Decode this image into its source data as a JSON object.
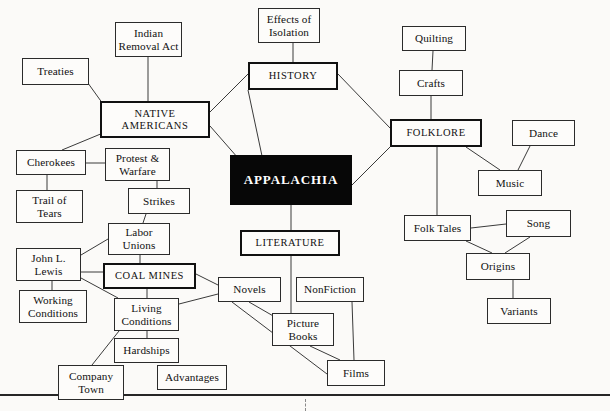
{
  "document": {
    "type": "concept-map",
    "title": "APPALACHIA",
    "background_color": "#fbfaf8",
    "ink_color": "#111111",
    "central_fill": "#070707",
    "central_text_color": "#ffffff"
  },
  "nodes": [
    {
      "id": "appalachia",
      "label": "APPALACHIA",
      "style": "central",
      "x": 230,
      "y": 155,
      "w": 122,
      "h": 50
    },
    {
      "id": "history",
      "label": "HISTORY",
      "style": "major",
      "x": 248,
      "y": 62,
      "w": 90,
      "h": 28
    },
    {
      "id": "native-americans",
      "label": "NATIVE\nAMERICANS",
      "style": "major",
      "x": 100,
      "y": 101,
      "w": 110,
      "h": 37
    },
    {
      "id": "folklore",
      "label": "FOLKLORE",
      "style": "major",
      "x": 390,
      "y": 119,
      "w": 92,
      "h": 28
    },
    {
      "id": "literature",
      "label": "LITERATURE",
      "style": "major",
      "x": 240,
      "y": 230,
      "w": 100,
      "h": 26
    },
    {
      "id": "coal-mines",
      "label": "COAL MINES",
      "style": "major",
      "x": 103,
      "y": 263,
      "w": 93,
      "h": 26
    },
    {
      "id": "effects-of-isolation",
      "label": "Effects of\nIsolation",
      "style": "sub",
      "x": 258,
      "y": 8,
      "w": 62,
      "h": 35
    },
    {
      "id": "indian-removal-act",
      "label": "Indian\nRemoval Act",
      "style": "sub",
      "x": 115,
      "y": 22,
      "w": 67,
      "h": 35
    },
    {
      "id": "treaties",
      "label": "Treaties",
      "style": "sub",
      "x": 22,
      "y": 58,
      "w": 67,
      "h": 27
    },
    {
      "id": "cherokees",
      "label": "Cherokees",
      "style": "sub",
      "x": 16,
      "y": 150,
      "w": 70,
      "h": 25
    },
    {
      "id": "trail-of-tears",
      "label": "Trail of\nTears",
      "style": "sub",
      "x": 16,
      "y": 190,
      "w": 67,
      "h": 33
    },
    {
      "id": "protest-warfare",
      "label": "Protest &\nWarfare",
      "style": "sub",
      "x": 105,
      "y": 148,
      "w": 65,
      "h": 33
    },
    {
      "id": "strikes",
      "label": "Strikes",
      "style": "sub",
      "x": 128,
      "y": 188,
      "w": 62,
      "h": 26
    },
    {
      "id": "labor-unions",
      "label": "Labor\nUnions",
      "style": "sub",
      "x": 108,
      "y": 223,
      "w": 62,
      "h": 32
    },
    {
      "id": "john-l-lewis",
      "label": "John L.\nLewis",
      "style": "sub",
      "x": 16,
      "y": 248,
      "w": 65,
      "h": 33
    },
    {
      "id": "working-conditions",
      "label": "Working\nConditions",
      "style": "sub",
      "x": 19,
      "y": 290,
      "w": 68,
      "h": 33
    },
    {
      "id": "living-conditions",
      "label": "Living\nConditions",
      "style": "sub",
      "x": 114,
      "y": 298,
      "w": 65,
      "h": 33
    },
    {
      "id": "hardships",
      "label": "Hardships",
      "style": "sub",
      "x": 114,
      "y": 338,
      "w": 65,
      "h": 25
    },
    {
      "id": "company-town",
      "label": "Company\nTown",
      "style": "sub",
      "x": 58,
      "y": 365,
      "w": 66,
      "h": 35
    },
    {
      "id": "advantages",
      "label": "Advantages",
      "style": "sub",
      "x": 157,
      "y": 365,
      "w": 70,
      "h": 25
    },
    {
      "id": "novels",
      "label": "Novels",
      "style": "sub",
      "x": 218,
      "y": 277,
      "w": 63,
      "h": 25
    },
    {
      "id": "nonfiction",
      "label": "NonFiction",
      "style": "sub",
      "x": 296,
      "y": 277,
      "w": 68,
      "h": 25
    },
    {
      "id": "picture-books",
      "label": "Picture\nBooks",
      "style": "sub",
      "x": 272,
      "y": 313,
      "w": 62,
      "h": 33
    },
    {
      "id": "films",
      "label": "Films",
      "style": "sub",
      "x": 327,
      "y": 360,
      "w": 58,
      "h": 26
    },
    {
      "id": "quilting",
      "label": "Quilting",
      "style": "sub",
      "x": 402,
      "y": 26,
      "w": 64,
      "h": 25
    },
    {
      "id": "crafts",
      "label": "Crafts",
      "style": "sub",
      "x": 399,
      "y": 70,
      "w": 64,
      "h": 26
    },
    {
      "id": "dance",
      "label": "Dance",
      "style": "sub",
      "x": 512,
      "y": 120,
      "w": 63,
      "h": 26
    },
    {
      "id": "music",
      "label": "Music",
      "style": "sub",
      "x": 478,
      "y": 170,
      "w": 64,
      "h": 26
    },
    {
      "id": "folk-tales",
      "label": "Folk Tales",
      "style": "sub",
      "x": 404,
      "y": 215,
      "w": 67,
      "h": 26
    },
    {
      "id": "song",
      "label": "Song",
      "style": "sub",
      "x": 506,
      "y": 210,
      "w": 65,
      "h": 27
    },
    {
      "id": "origins",
      "label": "Origins",
      "style": "sub",
      "x": 466,
      "y": 253,
      "w": 64,
      "h": 27
    },
    {
      "id": "variants",
      "label": "Variants",
      "style": "sub",
      "x": 487,
      "y": 298,
      "w": 64,
      "h": 26
    }
  ],
  "edges": [
    {
      "from": "appalachia",
      "to": "history",
      "x1": 262,
      "y1": 156,
      "x2": 248,
      "y2": 90
    },
    {
      "from": "appalachia",
      "to": "folklore",
      "x1": 352,
      "y1": 185,
      "x2": 390,
      "y2": 147
    },
    {
      "from": "appalachia",
      "to": "literature",
      "x1": 291,
      "y1": 205,
      "x2": 291,
      "y2": 230
    },
    {
      "from": "history",
      "to": "native-americans",
      "x1": 248,
      "y1": 74,
      "x2": 210,
      "y2": 112
    },
    {
      "from": "history",
      "to": "folklore",
      "x1": 338,
      "y1": 74,
      "x2": 390,
      "y2": 128
    },
    {
      "from": "history",
      "to": "effects-of-isolation",
      "x1": 293,
      "y1": 62,
      "x2": 293,
      "y2": 43
    },
    {
      "from": "native-americans",
      "to": "appalachia",
      "x1": 210,
      "y1": 126,
      "x2": 238,
      "y2": 158
    },
    {
      "from": "native-americans",
      "to": "indian-removal-act",
      "x1": 148,
      "y1": 101,
      "x2": 148,
      "y2": 57
    },
    {
      "from": "native-americans",
      "to": "treaties",
      "x1": 103,
      "y1": 104,
      "x2": 80,
      "y2": 72
    },
    {
      "from": "native-americans",
      "to": "cherokees",
      "x1": 103,
      "y1": 133,
      "x2": 62,
      "y2": 150
    },
    {
      "from": "cherokees",
      "to": "trail-of-tears",
      "x1": 47,
      "y1": 175,
      "x2": 47,
      "y2": 190
    },
    {
      "from": "cherokees",
      "to": "protest-warfare",
      "x1": 86,
      "y1": 163,
      "x2": 105,
      "y2": 163
    },
    {
      "from": "protest-warfare",
      "to": "strikes",
      "x1": 157,
      "y1": 181,
      "x2": 157,
      "y2": 188
    },
    {
      "from": "strikes",
      "to": "labor-unions",
      "x1": 146,
      "y1": 214,
      "x2": 143,
      "y2": 223
    },
    {
      "from": "labor-unions",
      "to": "coal-mines",
      "x1": 140,
      "y1": 255,
      "x2": 140,
      "y2": 263
    },
    {
      "from": "labor-unions",
      "to": "john-l-lewis",
      "x1": 108,
      "y1": 239,
      "x2": 81,
      "y2": 255
    },
    {
      "from": "john-l-lewis",
      "to": "coal-mines",
      "x1": 81,
      "y1": 272,
      "x2": 103,
      "y2": 272
    },
    {
      "from": "john-l-lewis",
      "to": "living-conditions",
      "x1": 81,
      "y1": 278,
      "x2": 118,
      "y2": 298
    },
    {
      "from": "working-conditions",
      "to": "john-l-lewis",
      "x1": 52,
      "y1": 290,
      "x2": 52,
      "y2": 281
    },
    {
      "from": "coal-mines",
      "to": "living-conditions",
      "x1": 147,
      "y1": 289,
      "x2": 147,
      "y2": 298
    },
    {
      "from": "coal-mines",
      "to": "novels",
      "x1": 196,
      "y1": 274,
      "x2": 218,
      "y2": 285
    },
    {
      "from": "living-conditions",
      "to": "hardships",
      "x1": 147,
      "y1": 331,
      "x2": 147,
      "y2": 338
    },
    {
      "from": "living-conditions",
      "to": "company-town",
      "x1": 119,
      "y1": 331,
      "x2": 92,
      "y2": 365
    },
    {
      "from": "living-conditions",
      "to": "novels",
      "x1": 179,
      "y1": 304,
      "x2": 218,
      "y2": 294
    },
    {
      "from": "literature",
      "to": "picture-books",
      "x1": 291,
      "y1": 256,
      "x2": 291,
      "y2": 313
    },
    {
      "from": "novels",
      "to": "picture-books",
      "x1": 249,
      "y1": 302,
      "x2": 275,
      "y2": 317
    },
    {
      "from": "novels",
      "to": "films",
      "x1": 232,
      "y1": 302,
      "x2": 327,
      "y2": 374
    },
    {
      "from": "nonfiction",
      "to": "films",
      "x1": 352,
      "y1": 302,
      "x2": 354,
      "y2": 360
    },
    {
      "from": "picture-books",
      "to": "films",
      "x1": 310,
      "y1": 346,
      "x2": 340,
      "y2": 360
    },
    {
      "from": "folklore",
      "to": "crafts",
      "x1": 431,
      "y1": 119,
      "x2": 431,
      "y2": 96
    },
    {
      "from": "crafts",
      "to": "quilting",
      "x1": 432,
      "y1": 70,
      "x2": 433,
      "y2": 51
    },
    {
      "from": "folklore",
      "to": "music",
      "x1": 466,
      "y1": 147,
      "x2": 500,
      "y2": 170
    },
    {
      "from": "dance",
      "to": "music",
      "x1": 530,
      "y1": 146,
      "x2": 518,
      "y2": 170
    },
    {
      "from": "folklore",
      "to": "folk-tales",
      "x1": 437,
      "y1": 147,
      "x2": 437,
      "y2": 215
    },
    {
      "from": "folk-tales",
      "to": "song",
      "x1": 471,
      "y1": 228,
      "x2": 506,
      "y2": 224
    },
    {
      "from": "folk-tales",
      "to": "origins",
      "x1": 466,
      "y1": 241,
      "x2": 492,
      "y2": 253
    },
    {
      "from": "song",
      "to": "origins",
      "x1": 530,
      "y1": 237,
      "x2": 505,
      "y2": 253
    },
    {
      "from": "origins",
      "to": "variants",
      "x1": 513,
      "y1": 280,
      "x2": 513,
      "y2": 298
    }
  ],
  "page_marks": {
    "rule_y": 394,
    "tick_x": 305,
    "tick_y": 399,
    "tick_height": 12
  }
}
